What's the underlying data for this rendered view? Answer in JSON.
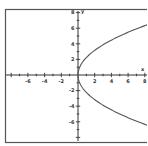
{
  "chart_data": {
    "type": "line",
    "title": "",
    "xlabel": "x",
    "ylabel": "y",
    "xlim": [
      -8,
      8
    ],
    "ylim": [
      -8,
      8
    ],
    "grid": false,
    "x_tick_labels": [
      "-6",
      "-4",
      "-2",
      "2",
      "4",
      "6",
      "8"
    ],
    "y_tick_labels": [
      "8",
      "6",
      "4",
      "2",
      "-2",
      "-4",
      "-6"
    ],
    "x_ticks": [
      -6,
      -4,
      -2,
      2,
      4,
      6,
      8
    ],
    "y_ticks": [
      8,
      6,
      4,
      2,
      -2,
      -4,
      -6
    ],
    "series": [
      {
        "name": "x = y^2/5",
        "equation": "y = ±sqrt(5x)",
        "color": "#555555",
        "x": [
          8,
          6,
          4,
          3,
          2,
          1,
          0.5,
          0.2,
          0,
          0.2,
          0.5,
          1,
          2,
          3,
          4,
          6,
          8
        ],
        "y": [
          6.32,
          5.48,
          4.47,
          3.87,
          3.16,
          2.24,
          1.58,
          1.0,
          0,
          -1.0,
          -1.58,
          -2.24,
          -3.16,
          -3.87,
          -4.47,
          -5.48,
          -6.32
        ]
      }
    ]
  },
  "style": {
    "axis_color": "#333333",
    "curve_color": "#555555",
    "frame_color": "#555555",
    "background": "#ffffff"
  }
}
